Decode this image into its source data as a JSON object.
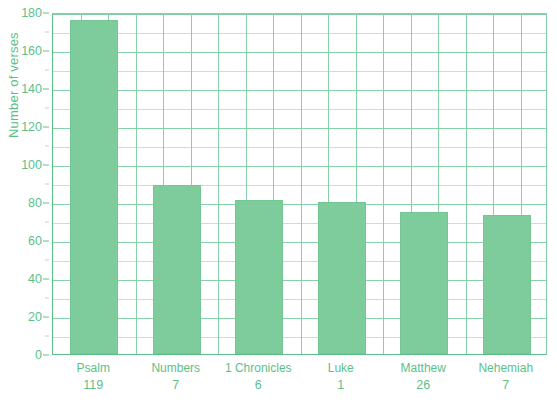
{
  "chart_data": {
    "type": "bar",
    "title": "",
    "xlabel": "",
    "ylabel": "Number of verses",
    "ylim": [
      0,
      180
    ],
    "ytick_step": 20,
    "yminor_step": 10,
    "grid": "both",
    "legend": "none",
    "categories": [
      "Psalm 119",
      "Numbers 7",
      "1 Chronicles 6",
      "Luke 1",
      "Matthew 26",
      "Nehemiah 7"
    ],
    "category_lines": [
      {
        "line1": "Psalm",
        "line2": "119"
      },
      {
        "line1": "Numbers",
        "line2": "7"
      },
      {
        "line1": "1 Chronicles",
        "line2": "6"
      },
      {
        "line1": "Luke",
        "line2": "1"
      },
      {
        "line1": "Matthew",
        "line2": "26"
      },
      {
        "line1": "Nehemiah",
        "line2": "7"
      }
    ],
    "values": [
      176,
      89,
      81,
      80,
      75,
      73
    ],
    "ytick_labels": [
      "0",
      "20",
      "40",
      "60",
      "80",
      "100",
      "120",
      "140",
      "160",
      "180"
    ],
    "ytick_values": [
      0,
      20,
      40,
      60,
      80,
      100,
      120,
      140,
      160,
      180
    ]
  },
  "colors": {
    "bar_fill": "#7ecb9b",
    "bar_stroke": "#74c693",
    "grid_major": "#86d2a8",
    "grid_minor": "#bde5cf",
    "axis": "#5bbf8a",
    "text": "#5bbf8a",
    "background": "#ffffff"
  }
}
